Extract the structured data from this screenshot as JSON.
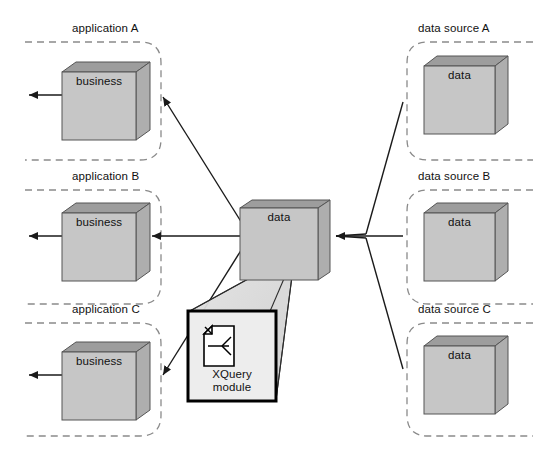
{
  "diagram": {
    "colors": {
      "box_front": "#c6c6c6",
      "box_top": "#9d9d9d",
      "box_side": "#b0b0b0",
      "box_outline": "#555555",
      "dashed_outline": "#8a8a8a",
      "connector": "#1a1a1a",
      "callout_fill": "#ededed",
      "callout_border": "#000000",
      "background": "#ffffff"
    },
    "applications": [
      {
        "group_label": "application A",
        "box_label": "business"
      },
      {
        "group_label": "application B",
        "box_label": "business"
      },
      {
        "group_label": "application C",
        "box_label": "business"
      }
    ],
    "hub": {
      "box_label": "data"
    },
    "data_sources": [
      {
        "group_label": "data source A",
        "box_label": "data"
      },
      {
        "group_label": "data source B",
        "box_label": "data"
      },
      {
        "group_label": "data source C",
        "box_label": "data"
      }
    ],
    "callout": {
      "label": "XQuery\nmodule",
      "icon": "xquery-document-icon"
    }
  }
}
